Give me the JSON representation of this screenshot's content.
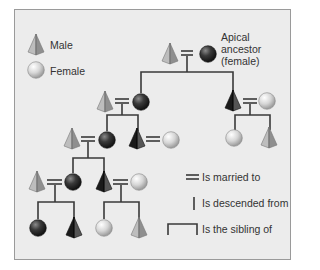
{
  "legend": {
    "male_label": "Male",
    "female_label": "Female",
    "married_label": "Is married to",
    "descended_label": "Is descended from",
    "sibling_label": "Is the sibling of"
  },
  "apical": {
    "line1": "Apical",
    "line2": "ancestor",
    "line3": "(female)"
  },
  "symbols": {
    "male": "pyramid-icon",
    "female": "sphere-icon",
    "lineage_member_color": "#2e2e2e",
    "non_member_color": "#c8c8c8"
  },
  "generations": [
    {
      "row": 1,
      "people": [
        {
          "sex": "male",
          "lineage": false
        },
        {
          "sex": "female",
          "lineage": true,
          "note": "apical ancestor"
        }
      ]
    },
    {
      "row": 2,
      "people": [
        {
          "sex": "male",
          "lineage": false
        },
        {
          "sex": "female",
          "lineage": true
        },
        {
          "sex": "male",
          "lineage": true
        },
        {
          "sex": "female",
          "lineage": false
        }
      ]
    },
    {
      "row": 3,
      "people": [
        {
          "sex": "male",
          "lineage": false
        },
        {
          "sex": "female",
          "lineage": true
        },
        {
          "sex": "male",
          "lineage": true
        },
        {
          "sex": "female",
          "lineage": false
        },
        {
          "sex": "female",
          "lineage": false
        },
        {
          "sex": "male",
          "lineage": false
        }
      ]
    },
    {
      "row": 4,
      "people": [
        {
          "sex": "female",
          "lineage": true
        },
        {
          "sex": "male",
          "lineage": true
        },
        {
          "sex": "female",
          "lineage": false
        },
        {
          "sex": "male",
          "lineage": false
        }
      ]
    }
  ]
}
